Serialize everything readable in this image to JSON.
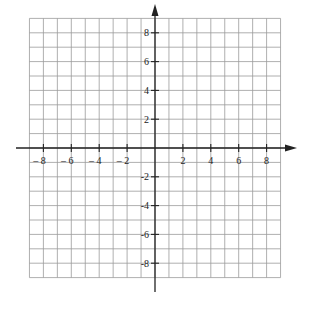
{
  "diagram": {
    "type": "coordinate-plane",
    "grid": {
      "x_min": -9,
      "x_max": 9,
      "y_min": -9,
      "y_max": 9,
      "step": 1
    },
    "colors": {
      "grid": "#9a9a9a",
      "axis": "#222222",
      "background": "#ffffff"
    },
    "x_axis": {
      "labels": [
        {
          "value": -8,
          "text": "– 8"
        },
        {
          "value": -6,
          "text": "– 6"
        },
        {
          "value": -4,
          "text": "– 4"
        },
        {
          "value": -2,
          "text": "– 2"
        },
        {
          "value": 2,
          "text": "2"
        },
        {
          "value": 4,
          "text": "4"
        },
        {
          "value": 6,
          "text": "6"
        },
        {
          "value": 8,
          "text": "8"
        }
      ]
    },
    "y_axis": {
      "labels": [
        {
          "value": 8,
          "text": "8"
        },
        {
          "value": 6,
          "text": "6"
        },
        {
          "value": 4,
          "text": "4"
        },
        {
          "value": 2,
          "text": "2"
        },
        {
          "value": -2,
          "text": "-2"
        },
        {
          "value": -4,
          "text": "-4"
        },
        {
          "value": -6,
          "text": "-6"
        },
        {
          "value": -8,
          "text": "-8"
        }
      ]
    }
  }
}
